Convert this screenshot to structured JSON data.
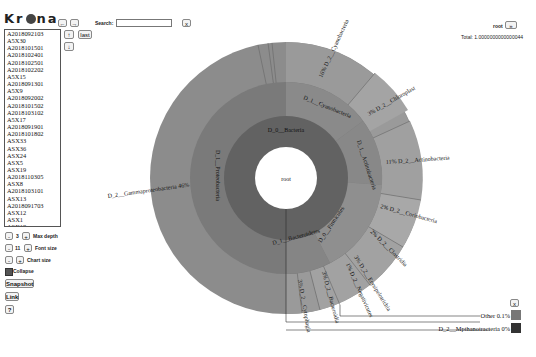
{
  "app": {
    "name": "Krona"
  },
  "toolbar": {
    "back_label": "←",
    "forward_label": "→",
    "search_label": "Search:",
    "search_value": "",
    "search_placeholder": "",
    "clear_label": "x",
    "up_label": "↑",
    "down_label": "↓",
    "last_label": "last"
  },
  "datasets": [
    "A2018092103",
    "A5X30",
    "A2018101501",
    "A2018102401",
    "A2018102501",
    "A2018102202",
    "A5X15",
    "A2018091301",
    "A5X9",
    "A2018092002",
    "A2018101502",
    "A2018103102",
    "A5X17",
    "A2018091901",
    "A2018101802",
    "ASX33",
    "ASX36",
    "ASX24",
    "ASX5",
    "ASX19",
    "A2018110305",
    "ASX8",
    "A2018103101",
    "ASX13",
    "A2018091703",
    "ASX12",
    "ASX1",
    "ASX18",
    "ASX11",
    "ASX6"
  ],
  "controls": {
    "max_depth": {
      "minus": "-",
      "value": "3",
      "plus": "+",
      "label": "Max depth"
    },
    "font_size": {
      "minus": "-",
      "value": "11",
      "plus": "+",
      "label": "Font size"
    },
    "chart_size": {
      "minus": "-",
      "plus": "+",
      "label": "Chart size"
    },
    "collapse": {
      "label": "Collapse",
      "checked": true
    },
    "snapshot_label": "Snapshot",
    "link_label": "Link",
    "help_label": "?"
  },
  "header_right": {
    "node": "root",
    "nav": "»",
    "total_label": "Total: 1.0000000000000044"
  },
  "chart": {
    "center_label": "root",
    "level0": "D_0__Bacteria",
    "level1": [
      "D_1__Proteobacteria",
      "D_1__Cyanobacteria",
      "D_1__Actinobacteria",
      "D_0__Firmicutes",
      "D_1__Bacteroidetes"
    ],
    "labels": {
      "cyano": "16% D_2__Cyanobacteria",
      "chloro": "3% D_2__Chloroplast",
      "actino": "11% D_2__Actinobacteria",
      "corio": "2% D_2__Coriobacteria",
      "clostr": "2% D_2__Clostridia",
      "erysip": "3% D_2__Erysipelotrichia",
      "negati": "1% D_2__Negativicutes",
      "bacter": "3% D_2__Bacteroidia",
      "cytoph": "3% D_2__Cytophagia",
      "gamma": "D_2__Gammaproteobacteria 46%"
    }
  },
  "legend": {
    "close_label": "x",
    "items": [
      {
        "label": "Other 0.1%",
        "color": "#777777"
      },
      {
        "label": "D_2__Mpthanotracteria 0%",
        "color": "#333333"
      }
    ]
  }
}
